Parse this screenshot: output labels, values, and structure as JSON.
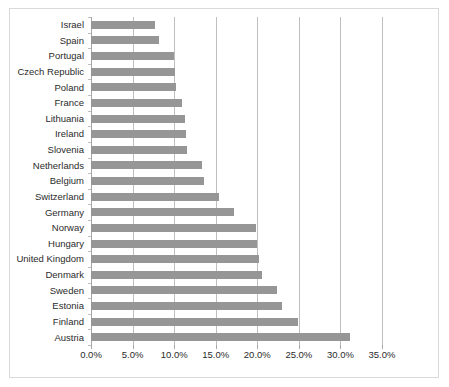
{
  "chart_data": {
    "type": "bar",
    "orientation": "horizontal",
    "title": "",
    "subtitle": "",
    "xlabel": "",
    "ylabel": "",
    "xlim": [
      0,
      35
    ],
    "xtick_labels": [
      "0.0%",
      "5.0%",
      "10.0%",
      "15.0%",
      "20.0%",
      "25.0%",
      "30.0%",
      "35.0%"
    ],
    "xticks": [
      0,
      5,
      10,
      15,
      20,
      25,
      30,
      35
    ],
    "grid": true,
    "legend": null,
    "legend_position": "none",
    "bar_color": "#969696",
    "categories": [
      "Israel",
      "Spain",
      "Portugal",
      "Czech Republic",
      "Poland",
      "France",
      "Lithuania",
      "Ireland",
      "Slovenia",
      "Netherlands",
      "Belgium",
      "Switzerland",
      "Germany",
      "Norway",
      "Hungary",
      "United Kingdom",
      "Denmark",
      "Sweden",
      "Estonia",
      "Finland",
      "Austria"
    ],
    "values": [
      7.7,
      8.2,
      10.0,
      10.1,
      10.2,
      11.0,
      11.3,
      11.4,
      11.5,
      13.3,
      13.6,
      15.4,
      17.2,
      19.8,
      20.0,
      20.2,
      20.6,
      22.4,
      23.0,
      24.9,
      31.1
    ],
    "value_labels": [
      "7.7%",
      "8.2%",
      "10.0%",
      "10.1%",
      "10.2%",
      "11.0%",
      "11.3%",
      "11.4%",
      "11.5%",
      "13.3%",
      "13.6%",
      "15.4%",
      "17.2%",
      "19.8%",
      "20.0%",
      "20.2%",
      "20.6%",
      "22.4%",
      "23.0%",
      "24.9%",
      "31.1%"
    ]
  }
}
